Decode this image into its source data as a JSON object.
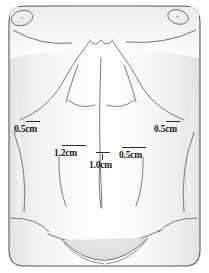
{
  "figure": {
    "unit": "cm",
    "colors": {
      "outline": "#555555",
      "detail_line": "#6b6b6b",
      "shade_light": "#f2f2f2",
      "shade_mid": "#e4e4e4",
      "shade_deep": "#d8d8d8",
      "label_text": "#1a1a1a",
      "tick": "#2a2a2a",
      "background": "#ffffff"
    }
  },
  "measurements": [
    {
      "id": "left-flank",
      "label": "0.5cm",
      "value": 0.5,
      "unit": "cm",
      "x": 14,
      "y": 125,
      "tick_x": 26,
      "tick_y": 121,
      "tick_w": 14
    },
    {
      "id": "center-left",
      "label": "1.2cm",
      "value": 1.2,
      "unit": "cm",
      "x": 54,
      "y": 149,
      "tick_x": 62,
      "tick_y": 145,
      "tick_w": 24
    },
    {
      "id": "center",
      "label": "1.0cm",
      "value": 1.0,
      "unit": "cm",
      "x": 89,
      "y": 161,
      "tick_x": 96,
      "tick_y": 152,
      "tick_w": 14
    },
    {
      "id": "center-right",
      "label": "0.5cm",
      "value": 0.5,
      "unit": "cm",
      "x": 119,
      "y": 151,
      "tick_x": 122,
      "tick_y": 147,
      "tick_w": 24
    },
    {
      "id": "right-flank",
      "label": "0.5cm",
      "value": 0.5,
      "unit": "cm",
      "x": 154,
      "y": 125,
      "tick_x": 166,
      "tick_y": 121,
      "tick_w": 14
    }
  ],
  "anatomy": {
    "regions": [
      "left-nipple-areola",
      "right-nipple-areola",
      "left-inframammary-fold",
      "right-inframammary-fold",
      "sternal-notch",
      "left-costal-margin",
      "right-costal-margin",
      "rectus-abdominis-left",
      "rectus-abdominis-right",
      "linea-alba",
      "tendinous-intersection-upper",
      "umbilicus-region",
      "left-flank-contour",
      "right-flank-contour",
      "lower-abdomen-fold",
      "pubic-mound"
    ]
  }
}
